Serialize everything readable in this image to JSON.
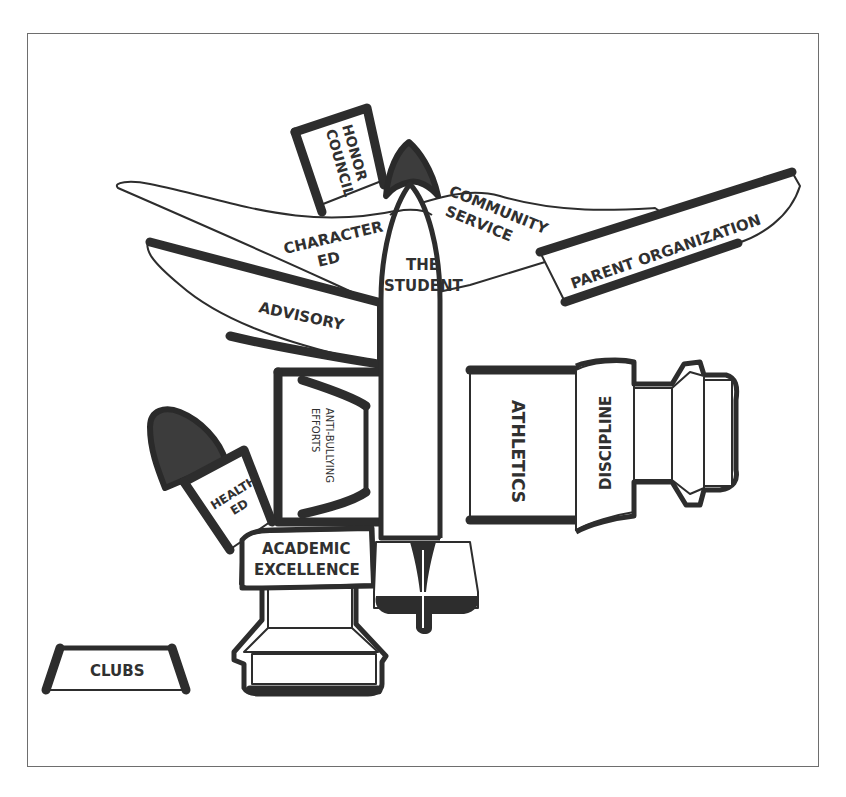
{
  "diagram": {
    "title": "",
    "colors": {
      "ink": "#2d2d2d",
      "fill_dark": "#3c3c3c",
      "paper": "#ffffff",
      "frame": "#6e6e6e"
    },
    "labels": {
      "honor_council_line1": "HONOR",
      "honor_council_line2": "COUNCIL",
      "character_ed_line1": "CHARACTER",
      "character_ed_line2": "ED",
      "community_service_line1": "COMMUNITY",
      "community_service_line2": "SERVICE",
      "parent_organization": "PARENT ORGANIZATION",
      "the_student_line1": "THE",
      "the_student_line2": "STUDENT",
      "advisory": "ADVISORY",
      "anti_bullying_line1": "ANTI-BULLYING",
      "anti_bullying_line2": "EFFORTS",
      "athletics": "ATHLETICS",
      "discipline": "DISCIPLINE",
      "health_ed_line1": "HEALTH",
      "health_ed_line2": "ED",
      "academic_excellence_line1": "ACADEMIC",
      "academic_excellence_line2": "EXCELLENCE",
      "clubs": "CLUBS"
    },
    "nodes": [
      {
        "id": "the-student",
        "label": "THE STUDENT",
        "role": "rocket body (center)"
      },
      {
        "id": "honor-council",
        "label": "HONOR COUNCIL",
        "role": "top panel"
      },
      {
        "id": "character-ed",
        "label": "CHARACTER ED",
        "role": "left upper wing"
      },
      {
        "id": "community-service",
        "label": "COMMUNITY SERVICE",
        "role": "right upper wing"
      },
      {
        "id": "parent-organization",
        "label": "PARENT ORGANIZATION",
        "role": "right wing panel"
      },
      {
        "id": "advisory",
        "label": "ADVISORY",
        "role": "left lower wing"
      },
      {
        "id": "anti-bullying-efforts",
        "label": "ANTI-BULLYING EFFORTS",
        "role": "left booster segment"
      },
      {
        "id": "athletics",
        "label": "ATHLETICS",
        "role": "right booster segment"
      },
      {
        "id": "discipline",
        "label": "DISCIPLINE",
        "role": "right booster collar"
      },
      {
        "id": "health-ed",
        "label": "HEALTH ED",
        "role": "small side rocket"
      },
      {
        "id": "academic-excellence",
        "label": "ACADEMIC EXCELLENCE",
        "role": "lower booster collar"
      },
      {
        "id": "clubs",
        "label": "CLUBS",
        "role": "detached piece"
      }
    ]
  }
}
